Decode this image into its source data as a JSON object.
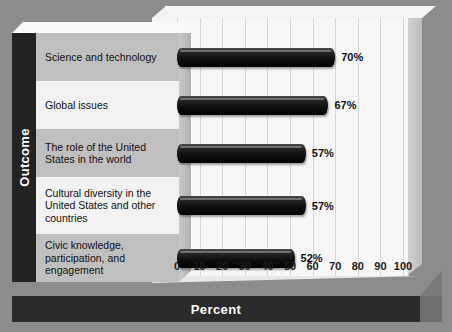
{
  "chart_data": {
    "type": "bar",
    "orientation": "horizontal",
    "title": "",
    "xlabel": "Percent",
    "ylabel": "Outcome",
    "xlim": [
      0,
      100
    ],
    "xticks": [
      "0",
      "10",
      "20",
      "30",
      "40",
      "50",
      "60",
      "70",
      "80",
      "90",
      "100"
    ],
    "grid": "vertical",
    "legend": "none",
    "categories": [
      "Science and technology",
      "Global issues",
      "The role of the United States in the world",
      "Cultural diversity in the United States and other countries",
      "Civic knowledge, participation, and engagement"
    ],
    "values": [
      70,
      67,
      57,
      57,
      52
    ],
    "data_labels": [
      "70%",
      "67%",
      "57%",
      "57%",
      "52%"
    ],
    "bar_color": "#111111",
    "plot_background": "#f7f7f7"
  },
  "axes": {
    "y_axis_title": "Outcome",
    "x_axis_title": "Percent"
  },
  "rows": [
    {
      "label": "Science and technology",
      "value_label": "70%"
    },
    {
      "label": "Global issues",
      "value_label": "67%"
    },
    {
      "label": "The role of the United States in the world",
      "value_label": "57%"
    },
    {
      "label": "Cultural diversity in the United States and other countries",
      "value_label": "57%"
    },
    {
      "label": "Civic knowledge, participation, and engagement",
      "value_label": "52%"
    }
  ],
  "colors": {
    "background": "#8c8c8c",
    "band_dark": "#232323",
    "row_shaded": "#bfbfbf",
    "row_light": "#f2f2f2",
    "bar": "#111111"
  }
}
